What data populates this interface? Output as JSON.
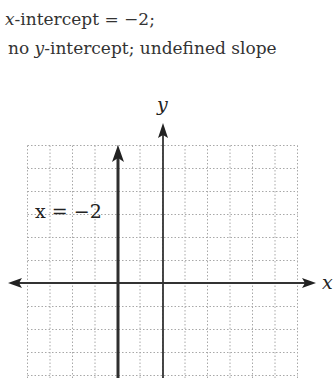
{
  "caption": {
    "line1": {
      "var": "x",
      "rest": "-intercept = −2;"
    },
    "line2": {
      "pre": "no ",
      "var": "y",
      "rest": "-intercept; undefined slope"
    }
  },
  "chart_data": {
    "type": "line",
    "title": "",
    "xlabel": "x",
    "ylabel": "y",
    "grid": true,
    "xlim": [
      -6,
      6
    ],
    "ylim": [
      -4,
      6
    ],
    "series": [
      {
        "name": "x = −2",
        "equation": "x = -2",
        "x": [
          -2,
          -2
        ],
        "y": [
          -4,
          6
        ],
        "style": "vertical line, arrow up"
      }
    ],
    "annotations": [
      {
        "text": "x = −2",
        "x": -5.8,
        "y": 3.3
      }
    ],
    "colors": {
      "grid": "#9a9a9a",
      "axis": "#333333",
      "line": "#333333"
    }
  }
}
